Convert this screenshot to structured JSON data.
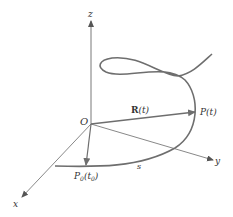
{
  "diagram": {
    "colors": {
      "axis": "#555555",
      "curve": "#6e6e6e",
      "vector": "#6e6e6e",
      "text": "#333333",
      "background": "#ffffff"
    },
    "axes": {
      "x_label": "x",
      "y_label": "y",
      "z_label": "z",
      "origin_label": "O"
    },
    "vectors": {
      "R": {
        "label_bold": "R",
        "label_arg": "(t)"
      },
      "P0": {
        "label": "P",
        "sub": "0",
        "arg_open": "(t",
        "arg_sub": "0",
        "arg_close": ")"
      }
    },
    "points": {
      "P": {
        "label": "P(t)"
      }
    },
    "arc_label": "s"
  }
}
